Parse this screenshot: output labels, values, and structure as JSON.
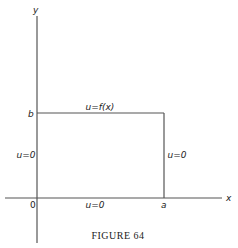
{
  "figure": {
    "caption": "FIGURE 64",
    "axes": {
      "x_label": "x",
      "y_label": "y",
      "origin_label": "0"
    },
    "rectangle": {
      "width_label": "a",
      "height_label": "b",
      "top_condition": "u=f(x)",
      "bottom_condition": "u=0",
      "left_condition": "u=0",
      "right_condition": "u=0"
    },
    "colors": {
      "line": "#555555",
      "text": "#222222",
      "background": "#ffffff"
    }
  }
}
